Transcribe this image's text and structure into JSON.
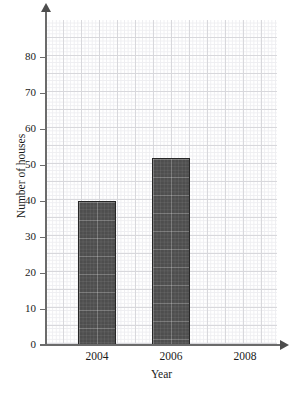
{
  "chart_data": {
    "type": "bar",
    "title": "",
    "xlabel": "Year",
    "ylabel": "Number of houses",
    "categories": [
      "2004",
      "2006",
      "2008"
    ],
    "values": [
      40,
      52,
      null
    ],
    "series": [
      {
        "name": "Number of houses",
        "values": [
          40,
          52,
          null
        ]
      }
    ],
    "ylim": [
      0,
      88
    ],
    "yticks": [
      0,
      10,
      20,
      30,
      40,
      50,
      60,
      70,
      80
    ],
    "ytick_labels": [
      "0",
      "10",
      "20",
      "30",
      "40",
      "50",
      "60",
      "70",
      "80"
    ],
    "xtick_labels": [
      "2004",
      "2006",
      "2008"
    ],
    "grid": true,
    "grid_style": "graph-paper minor and major squares",
    "legend": "none",
    "bar_color": "#4e4e4e",
    "bar_border_color": "#262626",
    "axis_color": "#6b6b6b",
    "grid_minor_color": "#eeeef1",
    "grid_major_color": "#d8d8dc",
    "background_color": "#ffffff"
  },
  "axes": {
    "y": {
      "title": "Number of houses",
      "ticks": [
        {
          "label": "80",
          "value": 80
        },
        {
          "label": "70",
          "value": 70
        },
        {
          "label": "60",
          "value": 60
        },
        {
          "label": "50",
          "value": 50
        },
        {
          "label": "40",
          "value": 40
        },
        {
          "label": "30",
          "value": 30
        },
        {
          "label": "20",
          "value": 20
        },
        {
          "label": "10",
          "value": 10
        },
        {
          "label": "0",
          "value": 0
        }
      ]
    },
    "x": {
      "title": "Year",
      "ticks": [
        {
          "label": "2004"
        },
        {
          "label": "2006"
        },
        {
          "label": "2008"
        }
      ]
    }
  },
  "bars": [
    {
      "category": "2004",
      "value": 40
    },
    {
      "category": "2006",
      "value": 52
    }
  ]
}
